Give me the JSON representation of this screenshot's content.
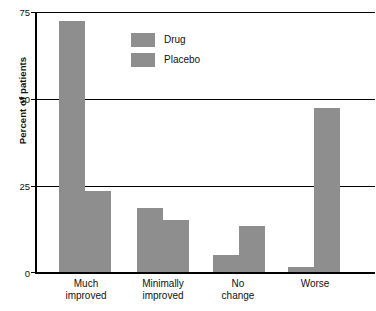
{
  "chart_data": {
    "type": "bar",
    "title": "",
    "xlabel": "",
    "ylabel": "Percent of patients",
    "categories": [
      "Much improved",
      "Minimally improved",
      "No change",
      "Worse"
    ],
    "category_lines": [
      [
        "Much",
        "improved"
      ],
      [
        "Minimally",
        "improved"
      ],
      [
        "No",
        "change"
      ],
      [
        "Worse",
        ""
      ]
    ],
    "series": [
      {
        "name": "Drug",
        "values": [
          72.5,
          18.5,
          5.0,
          1.7
        ]
      },
      {
        "name": "Placebo",
        "values": [
          23.5,
          15.0,
          13.5,
          47.5
        ]
      }
    ],
    "ylim": [
      0,
      75
    ],
    "yticks": [
      0,
      25,
      50,
      75
    ],
    "ytick_labels": [
      "0",
      "25",
      "50",
      "75"
    ],
    "grid": "horizontal",
    "legend_position": "upper-center",
    "bar_color": "#8e8e8e",
    "axis_color": "#000000"
  },
  "axis": {
    "y_title": "Percent of patients",
    "ticks": {
      "t75": "75",
      "t50": "50",
      "t25": "25",
      "t0": "0"
    }
  },
  "legend": {
    "items": [
      {
        "label": "Drug"
      },
      {
        "label": "Placebo"
      }
    ]
  },
  "categories": [
    {
      "line1": "Much",
      "line2": "improved"
    },
    {
      "line1": "Minimally",
      "line2": "improved"
    },
    {
      "line1": "No",
      "line2": "change"
    },
    {
      "line1": "Worse",
      "line2": ""
    }
  ]
}
